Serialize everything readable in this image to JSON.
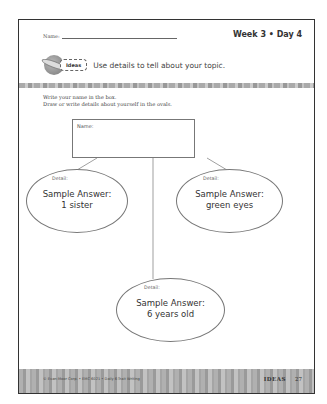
{
  "header": {
    "name_label": "Name:",
    "week_day": "Week 3 • Day 4"
  },
  "ideas": {
    "badge": "Ideas",
    "text": "Use details to tell about your topic.",
    "icon": "lightbulb-ball-icon"
  },
  "instructions": {
    "line1": "Write your name in the box.",
    "line2": "Draw or write details about yourself in the ovals."
  },
  "web": {
    "name_box_label": "Name:",
    "ovals": [
      {
        "label": "Detail:",
        "answer_line1": "Sample Answer:",
        "answer_line2": "1 sister"
      },
      {
        "label": "Detail:",
        "answer_line1": "Sample Answer:",
        "answer_line2": "green eyes"
      },
      {
        "label": "Detail:",
        "answer_line1": "Sample Answer:",
        "answer_line2": "6 years old"
      }
    ]
  },
  "footer": {
    "copyright": "© Evan-Moor Corp. • EMC 6021 • Daily 6-Trait Writing",
    "section": "IDEAS",
    "page_number": "27"
  }
}
